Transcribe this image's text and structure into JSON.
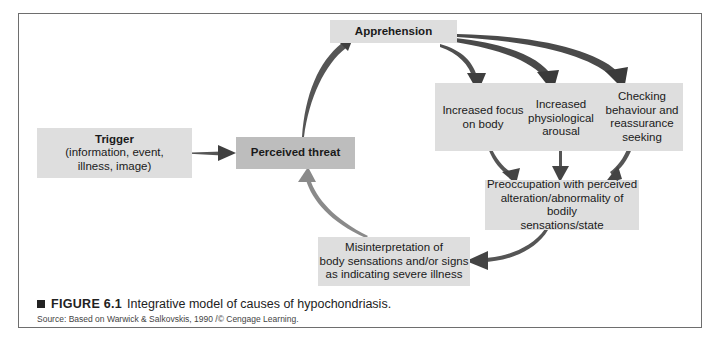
{
  "diagram": {
    "nodes": {
      "trigger": {
        "title": "Trigger",
        "lines": [
          "(information, event,",
          "illness, image)"
        ]
      },
      "perceived_threat": {
        "title": "Perceived threat"
      },
      "apprehension": {
        "title": "Apprehension"
      },
      "responses": {
        "focus": {
          "lines": [
            "Increased focus",
            "on body"
          ]
        },
        "arousal": {
          "lines": [
            "Increased",
            "physiological",
            "arousal"
          ]
        },
        "checking": {
          "lines": [
            "Checking",
            "behaviour and",
            "reassurance",
            "seeking"
          ]
        }
      },
      "preoccupation": {
        "lines": [
          "Preoccupation with perceived",
          "alteration/abnormality of bodily",
          "sensations/state"
        ]
      },
      "misinterpretation": {
        "lines": [
          "Misinterpretation of",
          "body sensations and/or signs",
          "as indicating severe illness"
        ]
      }
    },
    "edges": [
      [
        "Trigger",
        "Perceived threat"
      ],
      [
        "Perceived threat",
        "Apprehension"
      ],
      [
        "Apprehension",
        "Increased focus on body"
      ],
      [
        "Apprehension",
        "Increased physiological arousal"
      ],
      [
        "Apprehension",
        "Checking behaviour and reassurance seeking"
      ],
      [
        "Increased focus on body",
        "Preoccupation"
      ],
      [
        "Increased physiological arousal",
        "Preoccupation"
      ],
      [
        "Checking behaviour and reassurance seeking",
        "Preoccupation"
      ],
      [
        "Preoccupation",
        "Misinterpretation"
      ],
      [
        "Misinterpretation",
        "Perceived threat"
      ]
    ],
    "colors": {
      "box_light": "#dedede",
      "box_dark": "#bdbdbd",
      "arrow": "#4a4a4a",
      "arrow_light": "#8a8a8a"
    }
  },
  "caption": {
    "figure_label": "FIGURE 6.1",
    "text": "Integrative model of causes of hypochondriasis.",
    "source": "Source: Based on Warwick & Salkovskis, 1990 /© Cengage Learning."
  }
}
